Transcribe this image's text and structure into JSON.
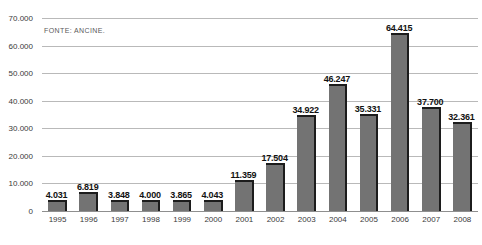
{
  "source_note": "FONTE: ANCINE.",
  "axis": {
    "y_ticks": [
      "0",
      "10.000",
      "20.000",
      "30.000",
      "40.000",
      "50.000",
      "60.000",
      "70.000"
    ]
  },
  "colors": {
    "bar_fill": "#737373",
    "bar_edge": "#1c1c1c",
    "gridline": "#b9b9b9",
    "background": "#ffffff",
    "label_text": "#111111",
    "tick_text": "#3a3a3a"
  },
  "chart_data": {
    "type": "bar",
    "title": "",
    "xlabel": "",
    "ylabel": "",
    "ylim": [
      0,
      70000
    ],
    "ytick_values": [
      0,
      10000,
      20000,
      30000,
      40000,
      50000,
      60000,
      70000
    ],
    "ytick_labels": [
      "0",
      "10.000",
      "20.000",
      "30.000",
      "40.000",
      "50.000",
      "60.000",
      "70.000"
    ],
    "grid": true,
    "legend": null,
    "annotations": [
      "FONTE: ANCINE."
    ],
    "categories": [
      "1995",
      "1996",
      "1997",
      "1998",
      "1999",
      "2000",
      "2001",
      "2002",
      "2003",
      "2004",
      "2005",
      "2006",
      "2007",
      "2008"
    ],
    "values": [
      4031,
      6819,
      3848,
      4000,
      3865,
      4043,
      11359,
      17504,
      34922,
      46247,
      35331,
      64415,
      37700,
      32361
    ],
    "value_labels": [
      "4.031",
      "6.819",
      "3.848",
      "4.000",
      "3.865",
      "4.043",
      "11.359",
      "17.504",
      "34.922",
      "46.247",
      "35.331",
      "64.415",
      "37.700",
      "32.361"
    ]
  }
}
